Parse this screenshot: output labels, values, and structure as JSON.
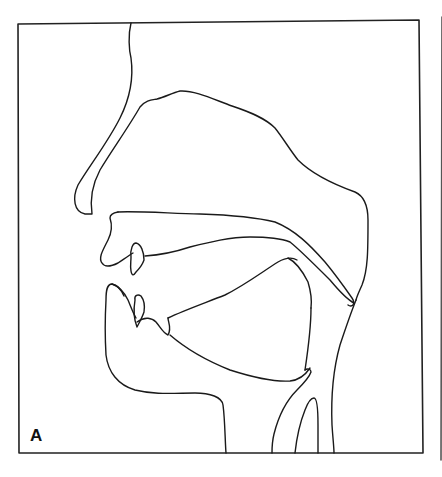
{
  "figure": {
    "type": "midsagittal vocal tract line drawing",
    "panel_label": "A",
    "colors": {
      "stroke": "#1a1a1a",
      "background": "#ffffff"
    },
    "parts": [
      "nose-profile",
      "nasal-cavity",
      "hard-palate",
      "velum",
      "upper-lip",
      "upper-teeth",
      "lower-lip",
      "lower-teeth",
      "tongue",
      "jaw",
      "pharynx-wall",
      "epiglottis",
      "larynx",
      "trachea"
    ]
  }
}
